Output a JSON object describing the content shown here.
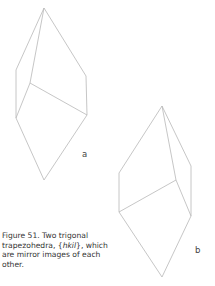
{
  "figure": {
    "caption_prefix": "Figure 51. Two trigonal trapezohedra, {",
    "caption_notation": "hkil",
    "caption_suffix": "}, which are mirror images of each other.",
    "line_color": "#b8b8b8",
    "crystals": [
      {
        "label": "a",
        "vertices": {
          "top": [
            44,
            8
          ],
          "left_upper": [
            16,
            70
          ],
          "left_lower": [
            16,
            118
          ],
          "inner": [
            30,
            83
          ],
          "right_upper": [
            86,
            76
          ],
          "right_lower": [
            87,
            115
          ],
          "bottom": [
            44,
            180
          ]
        }
      },
      {
        "label": "b",
        "vertices": {
          "top": [
            162,
            106
          ],
          "left_upper": [
            119,
            173
          ],
          "left_lower": [
            119,
            212
          ],
          "inner": [
            176,
            180
          ],
          "right_upper": [
            191,
            166
          ],
          "right_lower": [
            191,
            216
          ],
          "bottom": [
            162,
            277
          ]
        }
      }
    ]
  }
}
